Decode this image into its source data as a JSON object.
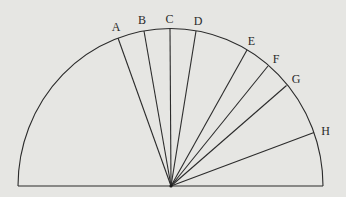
{
  "diagram": {
    "type": "semicircle-with-radial-lines",
    "center": {
      "x": 171,
      "y": 186
    },
    "baseline": {
      "x1": 18,
      "x2": 323,
      "y": 186
    },
    "radius_x": 152.5,
    "radius_y": 157.5,
    "stroke_color": "#2b2b2b",
    "background_color": "#e6e6e3",
    "points": [
      {
        "label": "A",
        "x": 118,
        "y": 38,
        "lx": 116,
        "ly": 31
      },
      {
        "label": "B",
        "x": 144,
        "y": 31,
        "lx": 142,
        "ly": 24
      },
      {
        "label": "C",
        "x": 170,
        "y": 28.5,
        "lx": 169.5,
        "ly": 23
      },
      {
        "label": "D",
        "x": 196,
        "y": 31,
        "lx": 198,
        "ly": 25
      },
      {
        "label": "E",
        "x": 247,
        "y": 50,
        "lx": 251.5,
        "ly": 45
      },
      {
        "label": "F",
        "x": 268,
        "y": 66,
        "lx": 276,
        "ly": 63
      },
      {
        "label": "G",
        "x": 286.5,
        "y": 85.5,
        "lx": 296,
        "ly": 83
      },
      {
        "label": "H",
        "x": 314,
        "y": 132.5,
        "lx": 325.5,
        "ly": 135
      }
    ]
  }
}
